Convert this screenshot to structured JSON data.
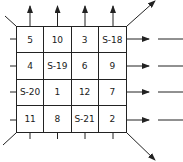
{
  "diagram": {
    "type": "magic-square-grid",
    "rows": [
      [
        "5",
        "10",
        "3",
        "S-18"
      ],
      [
        "4",
        "S-19",
        "6",
        "9"
      ],
      [
        "S-20",
        "1",
        "12",
        "7"
      ],
      [
        "11",
        "8",
        "S-21",
        "2"
      ]
    ],
    "line_color": "#222222",
    "arrows": {
      "top": 4,
      "right": 4,
      "diagonal_top_right": 1,
      "diagonal_bottom_right": 1
    }
  }
}
